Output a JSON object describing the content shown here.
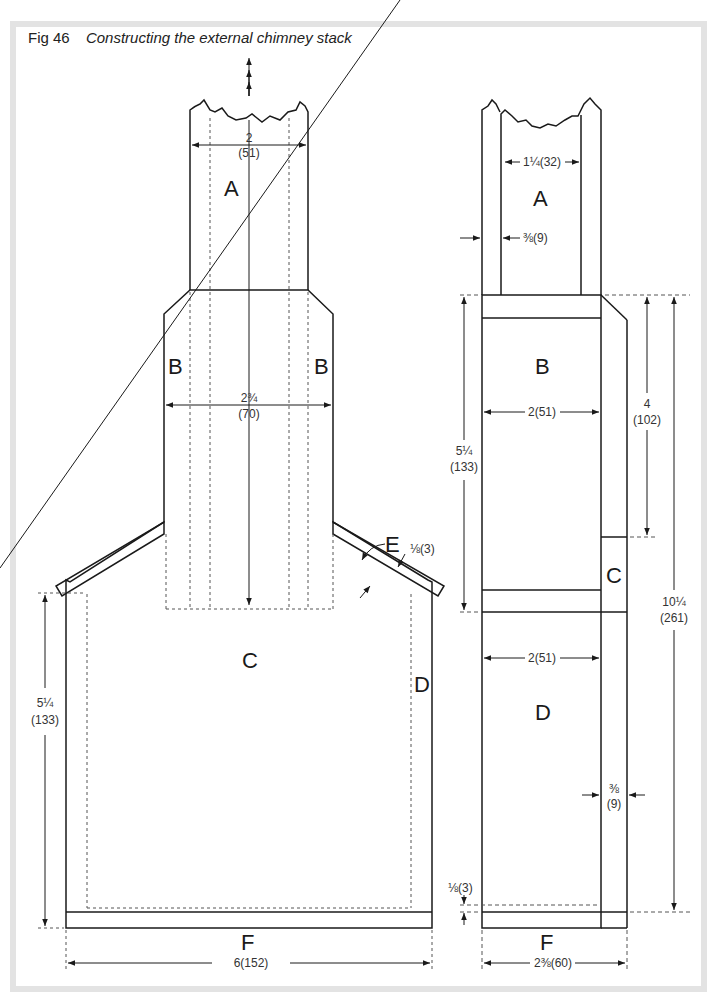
{
  "figure": {
    "number": "Fig 46",
    "title": "Constructing the external chimney stack"
  },
  "left_view": {
    "labels": {
      "A": "A",
      "B_left": "B",
      "B_right": "B",
      "C": "C",
      "D": "D",
      "E": "E",
      "F": "F"
    },
    "dimensions": {
      "flue_width_in": "2",
      "flue_width_mm": "(51)",
      "stack_width_in": "2¾",
      "stack_width_mm": "(70)",
      "roof_thickness": "⅛(3)",
      "wall_height_in": "5¼",
      "wall_height_mm": "(133)",
      "base_width": "6(152)"
    }
  },
  "right_view": {
    "labels": {
      "A": "A",
      "B": "B",
      "C": "C",
      "D": "D",
      "F": "F"
    },
    "dimensions": {
      "flue_width": "1¼(32)",
      "wall_thickness_top": "⅜(9)",
      "b_width": "2(51)",
      "d_width": "2(51)",
      "b_height_in": "5¼",
      "b_height_mm": "(133)",
      "upper_height_in": "4",
      "upper_height_mm": "(102)",
      "total_height_in": "10¼",
      "total_height_mm": "(261)",
      "back_thickness_in": "⅜",
      "back_thickness_mm": "(9)",
      "floor_gap": "⅛(3)",
      "base_width": "2⅜(60)"
    }
  },
  "colors": {
    "line": "#1a1a1a",
    "frame": "#e3e3e3",
    "dim_line": "#444444"
  }
}
